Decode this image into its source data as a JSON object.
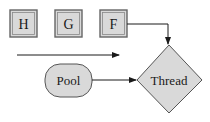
{
  "diagram": {
    "queue_items": [
      {
        "label": "H"
      },
      {
        "label": "G"
      },
      {
        "label": "F"
      }
    ],
    "pool": {
      "label": "Pool"
    },
    "thread": {
      "label": "Thread"
    },
    "colors": {
      "fill": "#d9d9d9",
      "stroke": "#555555",
      "arrow": "#1a1a1a",
      "background": "#ffffff"
    }
  }
}
